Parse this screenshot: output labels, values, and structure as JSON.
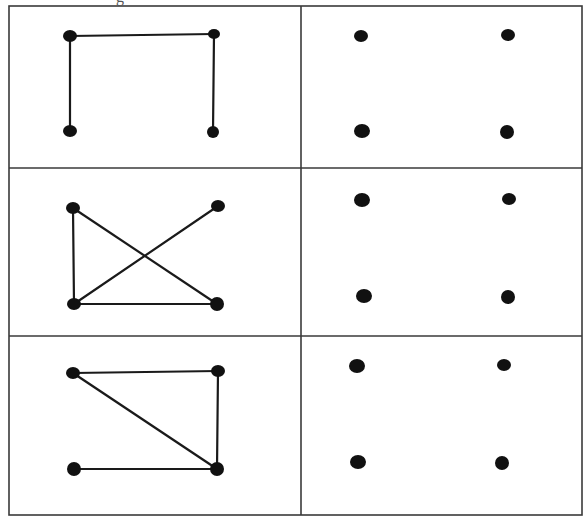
{
  "caption_fragment": "g",
  "colors": {
    "border": "#3a3a3a",
    "node": "#111111",
    "edge": "#1a1a1a",
    "background": "#ffffff"
  },
  "table": {
    "left": 9,
    "right": 582,
    "top": 6,
    "bottom": 515,
    "column_divider_x": 301,
    "row_dividers_y": [
      168,
      336
    ]
  },
  "rows": [
    {
      "left_cell": {
        "label": "graph-1",
        "nodes": [
          {
            "id": "TL",
            "x": 70,
            "y": 36,
            "rx": 7,
            "ry": 6
          },
          {
            "id": "TR",
            "x": 214,
            "y": 34,
            "rx": 6,
            "ry": 5
          },
          {
            "id": "BL",
            "x": 70,
            "y": 131,
            "rx": 7,
            "ry": 6
          },
          {
            "id": "BR",
            "x": 213,
            "y": 132,
            "rx": 6,
            "ry": 6
          }
        ],
        "edges": [
          [
            "TL",
            "TR"
          ],
          [
            "TL",
            "BL"
          ],
          [
            "TR",
            "BR"
          ]
        ]
      },
      "right_cell": {
        "label": "dots-1",
        "nodes": [
          {
            "id": "TL",
            "x": 361,
            "y": 36,
            "rx": 7,
            "ry": 6
          },
          {
            "id": "TR",
            "x": 508,
            "y": 35,
            "rx": 7,
            "ry": 6
          },
          {
            "id": "BL",
            "x": 362,
            "y": 131,
            "rx": 8,
            "ry": 7
          },
          {
            "id": "BR",
            "x": 507,
            "y": 132,
            "rx": 7,
            "ry": 7
          }
        ],
        "edges": []
      }
    },
    {
      "left_cell": {
        "label": "graph-2",
        "nodes": [
          {
            "id": "TL",
            "x": 73,
            "y": 208,
            "rx": 7,
            "ry": 6
          },
          {
            "id": "TR",
            "x": 218,
            "y": 206,
            "rx": 7,
            "ry": 6
          },
          {
            "id": "BL",
            "x": 74,
            "y": 304,
            "rx": 7,
            "ry": 6
          },
          {
            "id": "BR",
            "x": 217,
            "y": 304,
            "rx": 7,
            "ry": 7
          }
        ],
        "edges": [
          [
            "TL",
            "BL"
          ],
          [
            "TL",
            "BR"
          ],
          [
            "BL",
            "TR"
          ],
          [
            "BL",
            "BR"
          ]
        ]
      },
      "right_cell": {
        "label": "dots-2",
        "nodes": [
          {
            "id": "TL",
            "x": 362,
            "y": 200,
            "rx": 8,
            "ry": 7
          },
          {
            "id": "TR",
            "x": 509,
            "y": 199,
            "rx": 7,
            "ry": 6
          },
          {
            "id": "BL",
            "x": 364,
            "y": 296,
            "rx": 8,
            "ry": 7
          },
          {
            "id": "BR",
            "x": 508,
            "y": 297,
            "rx": 7,
            "ry": 7
          }
        ],
        "edges": []
      }
    },
    {
      "left_cell": {
        "label": "graph-3",
        "nodes": [
          {
            "id": "TL",
            "x": 73,
            "y": 373,
            "rx": 7,
            "ry": 6
          },
          {
            "id": "TR",
            "x": 218,
            "y": 371,
            "rx": 7,
            "ry": 6
          },
          {
            "id": "BL",
            "x": 74,
            "y": 469,
            "rx": 7,
            "ry": 7
          },
          {
            "id": "BR",
            "x": 217,
            "y": 469,
            "rx": 7,
            "ry": 7
          }
        ],
        "edges": [
          [
            "TL",
            "TR"
          ],
          [
            "TL",
            "BR"
          ],
          [
            "TR",
            "BR"
          ],
          [
            "BL",
            "BR"
          ]
        ]
      },
      "right_cell": {
        "label": "dots-3",
        "nodes": [
          {
            "id": "TL",
            "x": 357,
            "y": 366,
            "rx": 8,
            "ry": 7
          },
          {
            "id": "TR",
            "x": 504,
            "y": 365,
            "rx": 7,
            "ry": 6
          },
          {
            "id": "BL",
            "x": 358,
            "y": 462,
            "rx": 8,
            "ry": 7
          },
          {
            "id": "BR",
            "x": 502,
            "y": 463,
            "rx": 7,
            "ry": 7
          }
        ],
        "edges": []
      }
    }
  ]
}
